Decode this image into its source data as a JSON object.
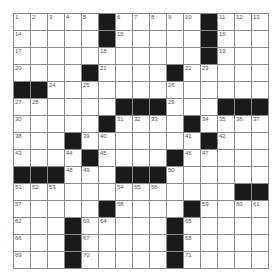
{
  "puzzle": {
    "rows": 15,
    "cols": 15,
    "colors": {
      "block": "#1a1a1a",
      "cell": "#ffffff",
      "grid_line": "#8a8a8a",
      "number": "#555555"
    },
    "blocks": [
      [
        0,
        5
      ],
      [
        0,
        11
      ],
      [
        1,
        5
      ],
      [
        1,
        11
      ],
      [
        2,
        11
      ],
      [
        3,
        4
      ],
      [
        3,
        9
      ],
      [
        4,
        0
      ],
      [
        4,
        1
      ],
      [
        5,
        6
      ],
      [
        5,
        7
      ],
      [
        5,
        8
      ],
      [
        5,
        12
      ],
      [
        5,
        13
      ],
      [
        5,
        14
      ],
      [
        6,
        5
      ],
      [
        6,
        10
      ],
      [
        7,
        3
      ],
      [
        7,
        11
      ],
      [
        8,
        4
      ],
      [
        8,
        9
      ],
      [
        9,
        0
      ],
      [
        9,
        1
      ],
      [
        9,
        2
      ],
      [
        9,
        6
      ],
      [
        9,
        7
      ],
      [
        9,
        8
      ],
      [
        10,
        13
      ],
      [
        10,
        14
      ],
      [
        11,
        5
      ],
      [
        11,
        10
      ],
      [
        12,
        3
      ],
      [
        12,
        9
      ],
      [
        13,
        3
      ],
      [
        13,
        9
      ],
      [
        14,
        3
      ],
      [
        14,
        9
      ]
    ],
    "numbers": [
      [
        0,
        0,
        "1"
      ],
      [
        0,
        1,
        "2"
      ],
      [
        0,
        2,
        "3"
      ],
      [
        0,
        3,
        "4"
      ],
      [
        0,
        4,
        "5"
      ],
      [
        0,
        6,
        "6"
      ],
      [
        0,
        7,
        "7"
      ],
      [
        0,
        8,
        "8"
      ],
      [
        0,
        9,
        "9"
      ],
      [
        0,
        10,
        "10"
      ],
      [
        0,
        12,
        "11"
      ],
      [
        0,
        13,
        "12"
      ],
      [
        0,
        14,
        "13"
      ],
      [
        1,
        0,
        "14"
      ],
      [
        1,
        6,
        "15"
      ],
      [
        1,
        12,
        "16"
      ],
      [
        2,
        0,
        "17"
      ],
      [
        2,
        5,
        "18"
      ],
      [
        2,
        12,
        "19"
      ],
      [
        3,
        0,
        "20"
      ],
      [
        3,
        5,
        "21"
      ],
      [
        3,
        10,
        "22"
      ],
      [
        3,
        11,
        "23"
      ],
      [
        4,
        2,
        "24"
      ],
      [
        4,
        4,
        "25"
      ],
      [
        4,
        9,
        "26"
      ],
      [
        5,
        0,
        "27"
      ],
      [
        5,
        1,
        "28"
      ],
      [
        5,
        9,
        "29"
      ],
      [
        6,
        0,
        "30"
      ],
      [
        6,
        6,
        "31"
      ],
      [
        6,
        7,
        "32"
      ],
      [
        6,
        8,
        "33"
      ],
      [
        6,
        11,
        "34"
      ],
      [
        6,
        12,
        "35"
      ],
      [
        6,
        13,
        "36"
      ],
      [
        6,
        14,
        "37"
      ],
      [
        7,
        0,
        "38"
      ],
      [
        7,
        4,
        "39"
      ],
      [
        7,
        5,
        "40"
      ],
      [
        7,
        10,
        "41"
      ],
      [
        7,
        12,
        "42"
      ],
      [
        8,
        0,
        "43"
      ],
      [
        8,
        3,
        "44"
      ],
      [
        8,
        5,
        "45"
      ],
      [
        8,
        10,
        "46"
      ],
      [
        8,
        11,
        "47"
      ],
      [
        9,
        3,
        "48"
      ],
      [
        9,
        4,
        "49"
      ],
      [
        9,
        9,
        "50"
      ],
      [
        10,
        0,
        "51"
      ],
      [
        10,
        1,
        "52"
      ],
      [
        10,
        2,
        "53"
      ],
      [
        10,
        6,
        "54"
      ],
      [
        10,
        7,
        "55"
      ],
      [
        10,
        8,
        "56"
      ],
      [
        11,
        0,
        "57"
      ],
      [
        11,
        6,
        "58"
      ],
      [
        11,
        11,
        "59"
      ],
      [
        11,
        13,
        "60"
      ],
      [
        11,
        14,
        "61"
      ],
      [
        12,
        0,
        "62"
      ],
      [
        12,
        4,
        "63"
      ],
      [
        12,
        5,
        "64"
      ],
      [
        12,
        10,
        "65"
      ],
      [
        13,
        0,
        "66"
      ],
      [
        13,
        4,
        "67"
      ],
      [
        13,
        10,
        "68"
      ],
      [
        14,
        0,
        "69"
      ],
      [
        14,
        4,
        "70"
      ],
      [
        14,
        10,
        "71"
      ]
    ]
  }
}
